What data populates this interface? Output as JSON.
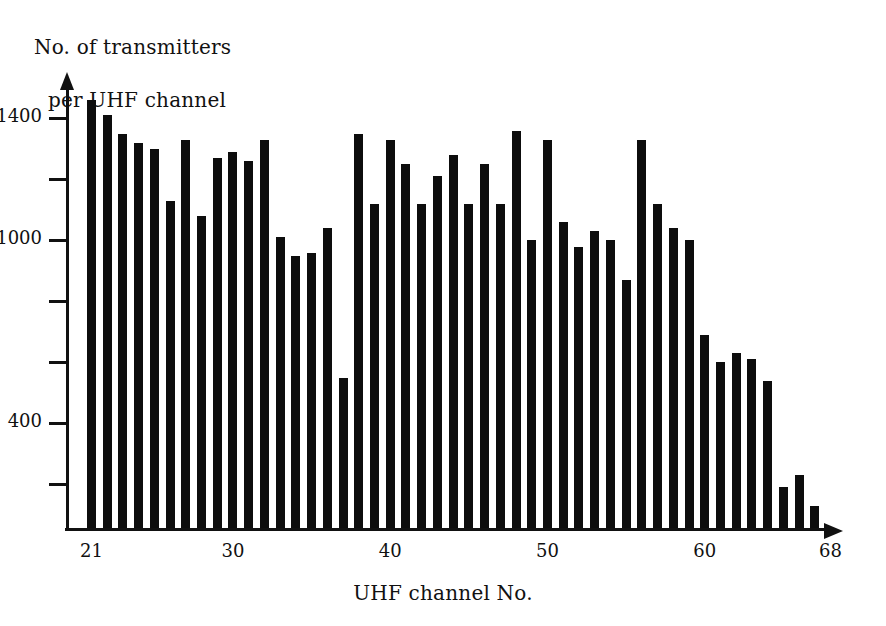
{
  "chart_data": {
    "type": "bar",
    "title": "",
    "ylabel": "No. of transmitters per UHF channel",
    "ylabel_line1": "No. of transmitters",
    "ylabel_line2": "per UHF channel",
    "xlabel": "UHF channel No.",
    "grid": false,
    "legend": null,
    "xlim": [
      20.4,
      68.6
    ],
    "ylim": [
      57,
      1500
    ],
    "ytick_values": [
      1400,
      1200,
      1000,
      800,
      600,
      400,
      200
    ],
    "ytick_labels_shown": [
      "1400",
      "1000",
      "400"
    ],
    "xtick_values": [
      21,
      30,
      40,
      50,
      60,
      68
    ],
    "xtick_labels": [
      "21",
      "30",
      "40",
      "50",
      "60",
      "68"
    ],
    "categories": [
      21,
      22,
      23,
      24,
      25,
      26,
      27,
      28,
      29,
      30,
      31,
      32,
      33,
      34,
      35,
      36,
      37,
      38,
      39,
      40,
      41,
      42,
      43,
      44,
      45,
      46,
      47,
      48,
      49,
      50,
      51,
      52,
      53,
      54,
      55,
      56,
      57,
      58,
      59,
      60,
      61,
      62,
      63,
      64,
      65,
      66,
      67,
      68
    ],
    "values": [
      1460,
      1410,
      1350,
      1320,
      1300,
      1130,
      1330,
      1080,
      1270,
      1290,
      1260,
      1330,
      1010,
      950,
      960,
      1040,
      550,
      1350,
      1120,
      1330,
      1250,
      1120,
      1210,
      1280,
      1120,
      1250,
      1120,
      1360,
      1000,
      1330,
      1060,
      980,
      1030,
      1000,
      870,
      1330,
      1120,
      1040,
      1000,
      690,
      600,
      630,
      610,
      540,
      190,
      230,
      130,
      0
    ],
    "bar_color": "#0d0d0d",
    "axis_color": "#111111",
    "background": "#ffffff"
  }
}
